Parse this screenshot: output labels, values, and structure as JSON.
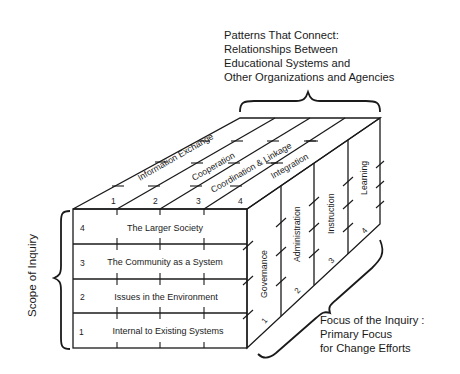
{
  "top_caption": {
    "lines": [
      "Patterns That Connect:",
      "Relationships Between",
      "Educational Systems and",
      "Other Organizations and Agencies"
    ]
  },
  "left_caption": "Scope of Inquiry",
  "bottom_right_caption": {
    "lines": [
      "Focus of the Inquiry :",
      "Primary Focus",
      "for Change Efforts"
    ]
  },
  "front_face": {
    "rows": [
      {
        "number": "4",
        "label": "The Larger Society"
      },
      {
        "number": "3",
        "label": "The Community as a System"
      },
      {
        "number": "2",
        "label": "Issues in the Environment"
      },
      {
        "number": "1",
        "label": "Internal to Existing Systems"
      }
    ]
  },
  "top_face": {
    "strips": [
      {
        "number": "1",
        "label": "Information Exchange"
      },
      {
        "number": "2",
        "label": "Cooperation"
      },
      {
        "number": "3",
        "label": "Coordination & Linkage"
      },
      {
        "number": "4",
        "label": "Integration"
      }
    ]
  },
  "right_face": {
    "columns": [
      {
        "number": "1",
        "label": "Governance"
      },
      {
        "number": "2",
        "label": "Administration"
      },
      {
        "number": "3",
        "label": "Instruction"
      },
      {
        "number": "4",
        "label": "Learning"
      }
    ]
  }
}
